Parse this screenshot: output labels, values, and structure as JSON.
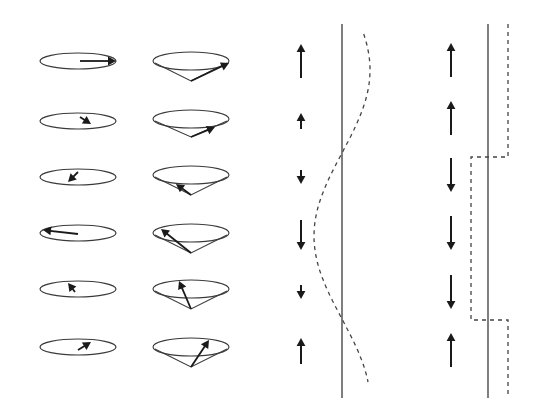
{
  "figure": {
    "colors": {
      "background": "#ffffff",
      "line": "#3a3a3a",
      "arrow": "#1a1a1a"
    }
  },
  "columns": [
    {
      "id": "precession-flat",
      "kind": "ellipse-with-in-plane-vector",
      "center_x": 78,
      "rx": 38,
      "ry": 8,
      "rows": [
        {
          "y": 61,
          "vector": {
            "x1": 80,
            "y1": 61,
            "x2": 116,
            "y2": 61
          }
        },
        {
          "y": 121,
          "vector": {
            "x1": 80,
            "y1": 117,
            "x2": 91,
            "y2": 124
          }
        },
        {
          "y": 177,
          "vector": {
            "x1": 78,
            "y1": 172,
            "x2": 68,
            "y2": 182
          }
        },
        {
          "y": 233,
          "vector": {
            "x1": 78,
            "y1": 234,
            "x2": 43,
            "y2": 230
          }
        },
        {
          "y": 289,
          "vector": {
            "x1": 75,
            "y1": 292,
            "x2": 68,
            "y2": 283
          }
        },
        {
          "y": 347,
          "vector": {
            "x1": 78,
            "y1": 350,
            "x2": 91,
            "y2": 342
          }
        }
      ]
    },
    {
      "id": "precession-cone",
      "kind": "cone-with-vector",
      "center_x": 191,
      "rx": 38,
      "ry": 9,
      "rows": [
        {
          "y": 61,
          "apex_y": 81,
          "vector": {
            "x2": 229,
            "y2": 63
          }
        },
        {
          "y": 119,
          "apex_y": 137,
          "vector": {
            "x2": 215,
            "y2": 127
          }
        },
        {
          "y": 175,
          "apex_y": 195,
          "vector": {
            "x2": 176,
            "y2": 184
          }
        },
        {
          "y": 233,
          "apex_y": 253,
          "vector": {
            "x2": 161,
            "y2": 229
          }
        },
        {
          "y": 289,
          "apex_y": 309,
          "vector": {
            "x2": 179,
            "y2": 281
          }
        },
        {
          "y": 347,
          "apex_y": 367,
          "vector": {
            "x2": 209,
            "y2": 340
          }
        }
      ]
    },
    {
      "id": "sinusoidal-spin-density-wave",
      "kind": "spin-arrows-with-sine-envelope",
      "arrow_x": 301,
      "axis": {
        "x": 342,
        "y1": 24,
        "y2": 398
      },
      "arrows": [
        {
          "y": 61,
          "direction": "up",
          "length": 34
        },
        {
          "y": 121,
          "direction": "up",
          "length": 16
        },
        {
          "y": 177,
          "direction": "down",
          "length": 14
        },
        {
          "y": 235,
          "direction": "down",
          "length": 30
        },
        {
          "y": 292,
          "direction": "down",
          "length": 14
        },
        {
          "y": 351,
          "direction": "up",
          "length": 26
        }
      ],
      "envelope": "sine"
    },
    {
      "id": "square-wave-spin-density-wave",
      "kind": "spin-arrows-with-square-envelope",
      "arrow_x": 451,
      "axis": {
        "x": 488,
        "y1": 24,
        "y2": 398
      },
      "arrows": [
        {
          "y": 60,
          "direction": "up",
          "length": 34
        },
        {
          "y": 118,
          "direction": "up",
          "length": 34
        },
        {
          "y": 175,
          "direction": "down",
          "length": 34
        },
        {
          "y": 233,
          "direction": "down",
          "length": 34
        },
        {
          "y": 292,
          "direction": "down",
          "length": 34
        },
        {
          "y": 350,
          "direction": "up",
          "length": 34
        }
      ],
      "envelope": {
        "high_x": 508,
        "low_x": 471,
        "step_down_y": 157,
        "step_up_y": 320,
        "y_top": 24,
        "y_bottom": 398
      }
    }
  ]
}
